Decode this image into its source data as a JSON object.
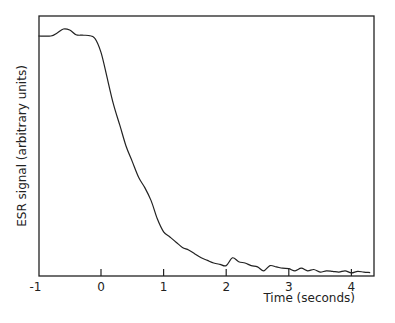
{
  "chart_data": {
    "type": "line",
    "title": "",
    "xlabel": "Time (seconds)",
    "ylabel": "ESR signal (arbitrary units)",
    "xlim": [
      -1,
      4.35
    ],
    "ylim": [
      0,
      100
    ],
    "xticks": [
      -1,
      0,
      1,
      2,
      3,
      4
    ],
    "xtick_labels": [
      "-1",
      "0",
      "1",
      "2",
      "3",
      "4"
    ],
    "yticks": [],
    "grid": false,
    "legend": null,
    "series": [
      {
        "name": "ESR signal",
        "x": [
          -1.0,
          -0.8,
          -0.7,
          -0.6,
          -0.5,
          -0.4,
          -0.3,
          -0.2,
          -0.1,
          0.0,
          0.1,
          0.2,
          0.3,
          0.4,
          0.5,
          0.6,
          0.7,
          0.8,
          0.9,
          1.0,
          1.1,
          1.2,
          1.3,
          1.4,
          1.5,
          1.6,
          1.7,
          1.8,
          1.9,
          2.0,
          2.1,
          2.2,
          2.3,
          2.4,
          2.5,
          2.6,
          2.7,
          2.8,
          2.9,
          3.0,
          3.1,
          3.2,
          3.3,
          3.4,
          3.5,
          3.6,
          3.7,
          3.8,
          3.9,
          4.0,
          4.1,
          4.2,
          4.3
        ],
        "values": [
          92.3,
          92.3,
          93.5,
          95.0,
          94.6,
          92.8,
          92.6,
          92.5,
          91.5,
          86,
          76,
          66,
          58,
          50,
          44,
          38,
          34,
          29,
          22,
          17,
          15,
          13,
          11,
          10,
          8.5,
          7,
          6,
          5,
          4.5,
          4,
          7,
          5.5,
          5,
          4,
          3.5,
          2,
          4,
          3.5,
          3,
          2.8,
          2,
          3,
          2,
          2.5,
          1.5,
          2,
          1.8,
          1.5,
          2,
          1.2,
          1.8,
          1.5,
          1.3
        ]
      }
    ]
  },
  "labels": {
    "ylabel": "ESR signal (arbitrary units)",
    "xlabel": "Time (seconds)",
    "xticks": [
      "-1",
      "0",
      "1",
      "2",
      "3",
      "4"
    ]
  }
}
